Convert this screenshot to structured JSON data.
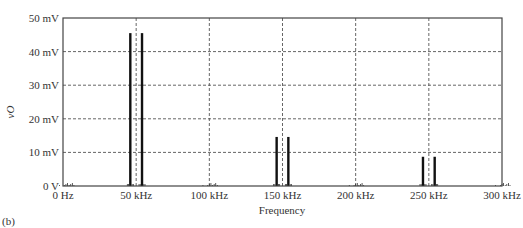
{
  "panel_label": "(b)",
  "chart_data": {
    "type": "bar",
    "title": "",
    "xlabel": "Frequency",
    "ylabel": "vO",
    "xlim": [
      0,
      300
    ],
    "ylim": [
      0,
      50
    ],
    "x_unit": "kHz",
    "y_unit": "mV",
    "grid": true,
    "x_ticks": [
      "0 Hz",
      "50 kHz",
      "100 kHz",
      "150 kHz",
      "200 kHz",
      "250 kHz",
      "300 kHz"
    ],
    "y_ticks": [
      "0 V",
      "10 mV",
      "20 mV",
      "30 mV",
      "40 mV",
      "50 mV"
    ],
    "x": [
      46,
      54,
      146,
      154,
      246,
      254
    ],
    "values": [
      45.5,
      45.5,
      14.6,
      14.6,
      8.7,
      8.7
    ],
    "noise_clusters_kHz": [
      2,
      100,
      200,
      300
    ]
  }
}
